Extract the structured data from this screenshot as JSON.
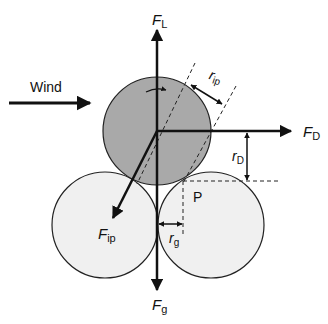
{
  "diagram": {
    "title": "",
    "labels": {
      "wind": "Wind",
      "lift_force": {
        "main": "F",
        "sub": "L"
      },
      "drag_force": {
        "main": "F",
        "sub": "D"
      },
      "interparticle_force": {
        "main": "F",
        "sub": "ip"
      },
      "gravity_force": {
        "main": "F",
        "sub": "g"
      },
      "lever_interparticle": {
        "main": "r",
        "sub": "ip"
      },
      "lever_drag": {
        "main": "r",
        "sub": "D"
      },
      "lever_gravity": {
        "main": "r",
        "sub": "g"
      },
      "pivot_point": "P"
    },
    "colors": {
      "top_particle_fill": "#a9a9a9",
      "bed_particle_fill": "#f0f0f0",
      "stroke": "#111111"
    },
    "particles": [
      {
        "name": "top-particle",
        "cx": 157,
        "cy": 131,
        "r": 54
      },
      {
        "name": "left-bed-particle",
        "cx": 105,
        "cy": 225,
        "r": 53
      },
      {
        "name": "right-bed-particle",
        "cx": 211,
        "cy": 225,
        "r": 53
      }
    ]
  }
}
